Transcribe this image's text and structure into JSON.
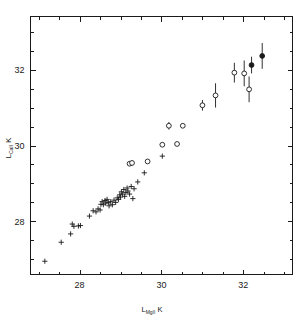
{
  "figure": {
    "title": "",
    "background_color": "#ffffff",
    "foreground_color": "#1a1a1a",
    "width": 304,
    "height": 321
  },
  "axes": {
    "x_title_main": "L",
    "x_title_sub": "MgII",
    "x_title_tail": " K",
    "y_title_main": "L",
    "y_title_sub": "CaII",
    "y_title_tail": " K",
    "x_ticks_major": [
      "28",
      "30",
      "32"
    ],
    "y_ticks_major": [
      "28",
      "30",
      "32"
    ]
  },
  "chart_data": {
    "type": "scatter",
    "title": "",
    "xlabel": "L_MgII K",
    "ylabel": "L_CaII K",
    "xlim": [
      26.8,
      33.2
    ],
    "ylim": [
      26.6,
      33.4
    ],
    "x_major_ticks": [
      28,
      30,
      32
    ],
    "y_major_ticks": [
      28,
      30,
      32
    ],
    "x_minor_tick_step": 0.5,
    "y_minor_tick_step": 0.5,
    "grid": false,
    "legend": null,
    "axis_scale": "log-luminosity (erg/s, log10)",
    "series": [
      {
        "name": "plus markers (no error bars)",
        "marker": "plus",
        "filled": false,
        "has_error_bars": false,
        "points": [
          {
            "x": 27.15,
            "y": 26.95
          },
          {
            "x": 27.55,
            "y": 27.45
          },
          {
            "x": 27.78,
            "y": 27.67
          },
          {
            "x": 27.82,
            "y": 27.93
          },
          {
            "x": 27.86,
            "y": 27.87
          },
          {
            "x": 27.97,
            "y": 27.88
          },
          {
            "x": 28.02,
            "y": 27.89
          },
          {
            "x": 28.24,
            "y": 28.14
          },
          {
            "x": 28.33,
            "y": 28.28
          },
          {
            "x": 28.4,
            "y": 28.25
          },
          {
            "x": 28.45,
            "y": 28.33
          },
          {
            "x": 28.5,
            "y": 28.3
          },
          {
            "x": 28.52,
            "y": 28.45
          },
          {
            "x": 28.55,
            "y": 28.52
          },
          {
            "x": 28.58,
            "y": 28.44
          },
          {
            "x": 28.62,
            "y": 28.55
          },
          {
            "x": 28.64,
            "y": 28.48
          },
          {
            "x": 28.67,
            "y": 28.58
          },
          {
            "x": 28.7,
            "y": 28.5
          },
          {
            "x": 28.72,
            "y": 28.41
          },
          {
            "x": 28.76,
            "y": 28.52
          },
          {
            "x": 28.8,
            "y": 28.44
          },
          {
            "x": 28.84,
            "y": 28.56
          },
          {
            "x": 28.88,
            "y": 28.5
          },
          {
            "x": 28.92,
            "y": 28.62
          },
          {
            "x": 28.95,
            "y": 28.58
          },
          {
            "x": 28.98,
            "y": 28.7
          },
          {
            "x": 29.0,
            "y": 28.64
          },
          {
            "x": 29.02,
            "y": 28.78
          },
          {
            "x": 29.05,
            "y": 28.72
          },
          {
            "x": 29.08,
            "y": 28.84
          },
          {
            "x": 29.1,
            "y": 28.66
          },
          {
            "x": 29.13,
            "y": 28.76
          },
          {
            "x": 29.16,
            "y": 28.88
          },
          {
            "x": 29.18,
            "y": 28.8
          },
          {
            "x": 29.22,
            "y": 28.72
          },
          {
            "x": 29.26,
            "y": 28.92
          },
          {
            "x": 29.3,
            "y": 28.6
          },
          {
            "x": 29.33,
            "y": 28.86
          },
          {
            "x": 29.42,
            "y": 29.04
          },
          {
            "x": 29.58,
            "y": 29.28
          },
          {
            "x": 30.02,
            "y": 29.72
          }
        ]
      },
      {
        "name": "open circles (with error bars)",
        "marker": "circle-open",
        "filled": false,
        "has_error_bars": true,
        "points": [
          {
            "x": 29.22,
            "y": 29.52,
            "yerr": 0.06
          },
          {
            "x": 29.28,
            "y": 29.54,
            "yerr": 0.06
          },
          {
            "x": 29.66,
            "y": 29.58,
            "yerr": 0.04
          },
          {
            "x": 30.02,
            "y": 30.02,
            "yerr": 0.05
          },
          {
            "x": 30.38,
            "y": 30.04,
            "yerr": 0.05
          },
          {
            "x": 30.18,
            "y": 30.52,
            "yerr": 0.1
          },
          {
            "x": 30.52,
            "y": 30.52,
            "yerr": 0.05
          },
          {
            "x": 31.0,
            "y": 31.06,
            "yerr": 0.14
          },
          {
            "x": 31.32,
            "y": 31.32,
            "yerr": 0.32
          },
          {
            "x": 31.78,
            "y": 31.92,
            "yerr": 0.26
          },
          {
            "x": 32.02,
            "y": 31.9,
            "yerr": 0.34
          },
          {
            "x": 32.14,
            "y": 31.48,
            "yerr": 0.34
          }
        ]
      },
      {
        "name": "filled circles (with error bars)",
        "marker": "circle-filled",
        "filled": true,
        "has_error_bars": true,
        "points": [
          {
            "x": 32.2,
            "y": 32.12,
            "yerr": 0.22
          },
          {
            "x": 32.46,
            "y": 32.36,
            "yerr": 0.34
          }
        ]
      }
    ]
  }
}
